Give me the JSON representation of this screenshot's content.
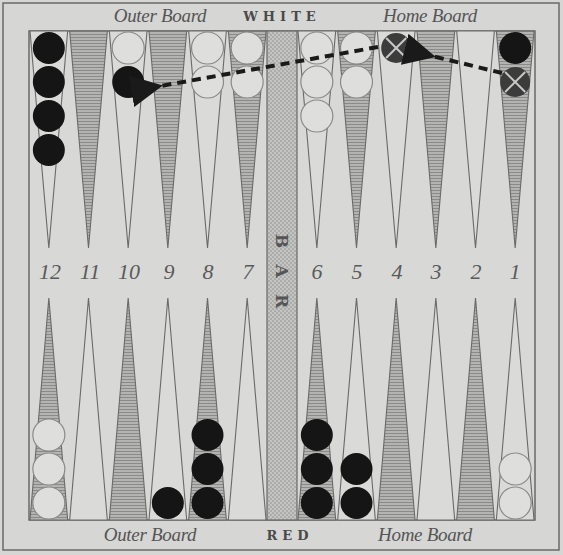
{
  "labels": {
    "top_left": "Outer Board",
    "top_center": "WHITE",
    "top_right": "Home Board",
    "bottom_left": "Outer Board",
    "bottom_center": "RED",
    "bottom_right": "Home Board",
    "bar_letters": [
      "B",
      "A",
      "R"
    ]
  },
  "point_numbers": [
    "12",
    "11",
    "10",
    "9",
    "8",
    "7",
    "6",
    "5",
    "4",
    "3",
    "2",
    "1"
  ],
  "colors": {
    "background": "#d6d6d4",
    "line": "#6a6a6a",
    "shaded_point": "#a9a9a7",
    "black_checker": "#151515",
    "white_checker": "#dcdcda",
    "ghost_checker": "#3a3a3a",
    "arrow": "#1a1a1a"
  },
  "top_row": [
    {
      "point": "12",
      "shaded": false,
      "checkers": [
        "black",
        "black",
        "black",
        "black"
      ]
    },
    {
      "point": "11",
      "shaded": true,
      "checkers": []
    },
    {
      "point": "10",
      "shaded": false,
      "checkers": [
        "white",
        "black"
      ]
    },
    {
      "point": "9",
      "shaded": true,
      "checkers": []
    },
    {
      "point": "8",
      "shaded": false,
      "checkers": [
        "white",
        "white"
      ]
    },
    {
      "point": "7",
      "shaded": true,
      "checkers": [
        "white",
        "white"
      ]
    },
    {
      "point": "6",
      "shaded": false,
      "checkers": [
        "white",
        "white",
        "white"
      ]
    },
    {
      "point": "5",
      "shaded": true,
      "checkers": [
        "white",
        "white"
      ]
    },
    {
      "point": "4",
      "shaded": false,
      "checkers": [
        "ghost"
      ]
    },
    {
      "point": "3",
      "shaded": true,
      "checkers": []
    },
    {
      "point": "2",
      "shaded": false,
      "checkers": []
    },
    {
      "point": "1",
      "shaded": true,
      "checkers": [
        "black",
        "ghost"
      ]
    }
  ],
  "bottom_row": [
    {
      "point": "12",
      "shaded": true,
      "checkers": [
        "white",
        "white",
        "white"
      ]
    },
    {
      "point": "11",
      "shaded": false,
      "checkers": []
    },
    {
      "point": "10",
      "shaded": true,
      "checkers": []
    },
    {
      "point": "9",
      "shaded": false,
      "checkers": [
        "black"
      ]
    },
    {
      "point": "8",
      "shaded": true,
      "checkers": [
        "black",
        "black",
        "black"
      ]
    },
    {
      "point": "7",
      "shaded": false,
      "checkers": []
    },
    {
      "point": "6",
      "shaded": true,
      "checkers": [
        "black",
        "black",
        "black"
      ]
    },
    {
      "point": "5",
      "shaded": false,
      "checkers": [
        "black",
        "black"
      ]
    },
    {
      "point": "4",
      "shaded": true,
      "checkers": []
    },
    {
      "point": "3",
      "shaded": false,
      "checkers": []
    },
    {
      "point": "2",
      "shaded": true,
      "checkers": []
    },
    {
      "point": "1",
      "shaded": false,
      "checkers": [
        "white",
        "white"
      ]
    }
  ],
  "moves": [
    {
      "from": "1",
      "to": "4",
      "style": "dashed-arrow"
    },
    {
      "from": "4",
      "to": "10",
      "style": "dashed-arrow"
    }
  ]
}
